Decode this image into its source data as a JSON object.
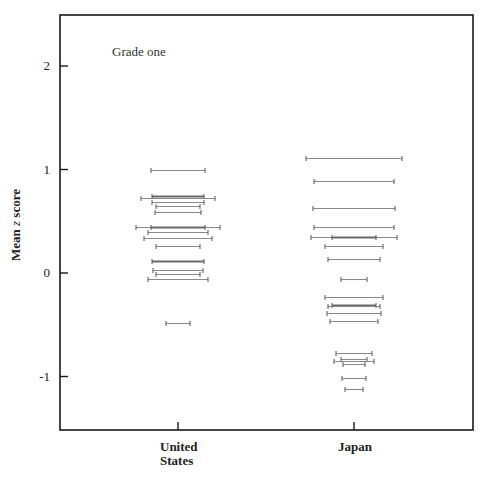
{
  "chart_data": {
    "type": "scatter",
    "subtype": "horizontal-interval-markers",
    "title": "",
    "annotation": "Grade one",
    "xlabel": "",
    "ylabel": "Mean z score",
    "ylabel_parts": {
      "prefix": "Mean ",
      "italic": "z",
      "suffix": " score"
    },
    "categories": [
      "United\nStates",
      "Japan"
    ],
    "category_label_lines": [
      [
        "United",
        "States"
      ],
      [
        "Japan"
      ]
    ],
    "yticks": [
      2,
      1,
      0,
      -1
    ],
    "ytick_labels": [
      "2",
      "1",
      "0",
      "-1"
    ],
    "ylim": [
      -1.53,
      2.49
    ],
    "grid": false,
    "legend": null,
    "series": [
      {
        "name": "United States",
        "category_index": 0,
        "points": [
          {
            "z": 1.0,
            "half_width": 27,
            "thick": false
          },
          {
            "z": 0.74,
            "half_width": 26,
            "thick": true
          },
          {
            "z": 0.72,
            "half_width": 37,
            "thick": false
          },
          {
            "z": 0.69,
            "half_width": 26,
            "thick": false
          },
          {
            "z": 0.65,
            "half_width": 22,
            "thick": false
          },
          {
            "z": 0.59,
            "half_width": 23,
            "thick": false
          },
          {
            "z": 0.44,
            "half_width": 42,
            "thick": false
          },
          {
            "z": 0.44,
            "half_width": 27,
            "thick": true
          },
          {
            "z": 0.4,
            "half_width": 30,
            "thick": false
          },
          {
            "z": 0.34,
            "half_width": 34,
            "thick": false
          },
          {
            "z": 0.26,
            "half_width": 22,
            "thick": false
          },
          {
            "z": 0.12,
            "half_width": 26,
            "thick": true
          },
          {
            "z": 0.03,
            "half_width": 25,
            "thick": false
          },
          {
            "z": -0.01,
            "half_width": 22,
            "thick": false
          },
          {
            "z": -0.06,
            "half_width": 30,
            "thick": false
          },
          {
            "z": -0.48,
            "half_width": 12,
            "thick": false
          }
        ]
      },
      {
        "name": "Japan",
        "category_index": 1,
        "points": [
          {
            "z": 1.11,
            "half_width": 48,
            "thick": false
          },
          {
            "z": 0.89,
            "half_width": 40,
            "thick": false
          },
          {
            "z": 0.63,
            "half_width": 41,
            "thick": false
          },
          {
            "z": 0.44,
            "half_width": 40,
            "thick": false
          },
          {
            "z": 0.35,
            "half_width": 43,
            "thick": false
          },
          {
            "z": 0.35,
            "half_width": 22,
            "thick": true
          },
          {
            "z": 0.26,
            "half_width": 29,
            "thick": false
          },
          {
            "z": 0.14,
            "half_width": 26,
            "thick": false
          },
          {
            "z": -0.06,
            "half_width": 13,
            "thick": false
          },
          {
            "z": -0.23,
            "half_width": 29,
            "thick": false
          },
          {
            "z": -0.31,
            "half_width": 22,
            "thick": true
          },
          {
            "z": -0.32,
            "half_width": 26,
            "thick": false
          },
          {
            "z": -0.39,
            "half_width": 27,
            "thick": false
          },
          {
            "z": -0.46,
            "half_width": 24,
            "thick": false
          },
          {
            "z": -0.77,
            "half_width": 18,
            "thick": false
          },
          {
            "z": -0.83,
            "half_width": 13,
            "thick": false
          },
          {
            "z": -0.85,
            "half_width": 20,
            "thick": false
          },
          {
            "z": -0.88,
            "half_width": 11,
            "thick": false
          },
          {
            "z": -1.01,
            "half_width": 12,
            "thick": false
          },
          {
            "z": -1.12,
            "half_width": 9,
            "thick": false
          }
        ]
      }
    ]
  },
  "layout_px": {
    "frame": {
      "left": 60,
      "top": 15,
      "right": 473,
      "bottom": 430
    },
    "zero_y": 273,
    "px_per_unit": 103.5,
    "category_x": [
      178,
      354
    ]
  },
  "labels": {
    "annotation": "Grade one",
    "ylabel_prefix": "Mean ",
    "ylabel_italic": "z",
    "ylabel_suffix": " score",
    "cat_us_line1": "United",
    "cat_us_line2": "States",
    "cat_japan": "Japan"
  }
}
